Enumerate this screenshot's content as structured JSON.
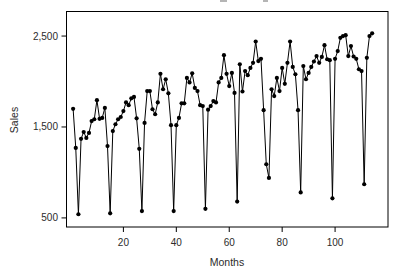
{
  "figure": {
    "xlabel": "Months",
    "ylabel": "Sales",
    "note": "cropped title remnants visible at top edge"
  },
  "chart_data": {
    "type": "line",
    "title": "",
    "xlabel": "Months",
    "ylabel": "Sales",
    "x_description": "consecutive month index, 1 to 114",
    "x_start": 1,
    "values": [
      1700,
      1270,
      540,
      1370,
      1445,
      1380,
      1435,
      1565,
      1585,
      1795,
      1590,
      1600,
      1710,
      1290,
      550,
      1455,
      1530,
      1585,
      1610,
      1675,
      1770,
      1740,
      1815,
      1830,
      1595,
      1260,
      575,
      1545,
      1895,
      1895,
      1695,
      1640,
      1770,
      2085,
      1915,
      2025,
      1870,
      1520,
      575,
      1520,
      1600,
      1760,
      1760,
      2040,
      1990,
      2090,
      1930,
      1895,
      1740,
      1730,
      600,
      1690,
      1730,
      1785,
      1770,
      1990,
      2040,
      2290,
      2085,
      1950,
      2095,
      1875,
      680,
      2190,
      1890,
      2115,
      2070,
      2150,
      2205,
      2440,
      2225,
      2250,
      1685,
      1090,
      940,
      1915,
      1840,
      2040,
      1895,
      2150,
      1975,
      2205,
      2440,
      2160,
      2080,
      1685,
      780,
      2170,
      2025,
      2095,
      2160,
      2220,
      2280,
      2205,
      2270,
      2400,
      2245,
      2235,
      715,
      2250,
      2335,
      2480,
      2500,
      2510,
      2280,
      2390,
      2275,
      2250,
      2135,
      2115,
      870,
      2260,
      2500,
      2530
    ],
    "xticks": {
      "values": [
        20,
        40,
        60,
        80,
        100
      ],
      "labels": [
        "20",
        "40",
        "60",
        "80",
        "100"
      ]
    },
    "yticks": {
      "values": [
        500,
        1500,
        2500
      ],
      "labels": [
        "500",
        "1,500",
        "2,500"
      ]
    },
    "xlim": [
      -1.5,
      120
    ],
    "ylim": [
      400,
      2770
    ],
    "grid": false,
    "frame": "full-box",
    "line_color": "#000000",
    "marker": "filled-circle",
    "marker_color": "#000000",
    "background_color": "#ffffff"
  }
}
